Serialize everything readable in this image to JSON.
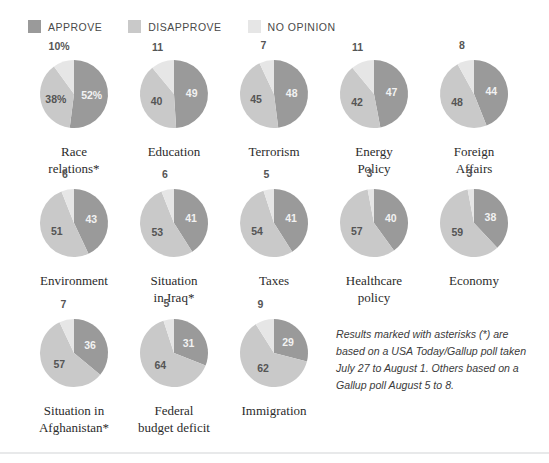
{
  "legend": {
    "items": [
      {
        "label": "APPROVE",
        "key": "approve",
        "color": "#9a9a9a"
      },
      {
        "label": "DISAPPROVE",
        "key": "disapprove",
        "color": "#c9c9c9"
      },
      {
        "label": "NO OPINION",
        "key": "noopinion",
        "color": "#e6e6e6"
      }
    ]
  },
  "footnote": {
    "text": "Results marked with asterisks (*) are based on a USA Today/Gallup poll taken July 27 to August 1. Others based on a Gallup poll August 5 to 8."
  },
  "chart_data": {
    "type": "pie",
    "title": "",
    "legend": [
      "APPROVE",
      "DISAPPROVE",
      "NO OPINION"
    ],
    "legend_position": "top-left",
    "series_colors": [
      "#9a9a9a",
      "#c9c9c9",
      "#e6e6e6"
    ],
    "value_unit": "percent",
    "note": "Results marked with asterisks (*) are based on a USA Today/Gallup poll taken July 27 to August 1. Others based on a Gallup poll August 5 to 8.",
    "charts": [
      {
        "label": "Race relations*",
        "label_lines": [
          "Race",
          "relations*"
        ],
        "approve": 52,
        "disapprove": 38,
        "no_opinion": 10,
        "approve_text": "52%",
        "disapprove_text": "38%",
        "no_opinion_text": "10%"
      },
      {
        "label": "Education",
        "label_lines": [
          "Education"
        ],
        "approve": 49,
        "disapprove": 40,
        "no_opinion": 11,
        "approve_text": "49",
        "disapprove_text": "40",
        "no_opinion_text": "11"
      },
      {
        "label": "Terrorism",
        "label_lines": [
          "Terrorism"
        ],
        "approve": 48,
        "disapprove": 45,
        "no_opinion": 7,
        "approve_text": "48",
        "disapprove_text": "45",
        "no_opinion_text": "7"
      },
      {
        "label": "Energy Policy",
        "label_lines": [
          "Energy",
          "Policy"
        ],
        "approve": 47,
        "disapprove": 42,
        "no_opinion": 11,
        "approve_text": "47",
        "disapprove_text": "42",
        "no_opinion_text": "11"
      },
      {
        "label": "Foreign Affairs",
        "label_lines": [
          "Foreign",
          "Affairs"
        ],
        "approve": 44,
        "disapprove": 48,
        "no_opinion": 8,
        "approve_text": "44",
        "disapprove_text": "48",
        "no_opinion_text": "8"
      },
      {
        "label": "Environment",
        "label_lines": [
          "Environment"
        ],
        "approve": 43,
        "disapprove": 51,
        "no_opinion": 6,
        "approve_text": "43",
        "disapprove_text": "51",
        "no_opinion_text": "6"
      },
      {
        "label": "Situation in Iraq*",
        "label_lines": [
          "Situation",
          "in Iraq*"
        ],
        "approve": 41,
        "disapprove": 53,
        "no_opinion": 6,
        "approve_text": "41",
        "disapprove_text": "53",
        "no_opinion_text": "6"
      },
      {
        "label": "Taxes",
        "label_lines": [
          "Taxes"
        ],
        "approve": 41,
        "disapprove": 54,
        "no_opinion": 5,
        "approve_text": "41",
        "disapprove_text": "54",
        "no_opinion_text": "5"
      },
      {
        "label": "Healthcare policy",
        "label_lines": [
          "Healthcare",
          "policy"
        ],
        "approve": 40,
        "disapprove": 57,
        "no_opinion": 3,
        "approve_text": "40",
        "disapprove_text": "57",
        "no_opinion_text": "3"
      },
      {
        "label": "Economy",
        "label_lines": [
          "Economy"
        ],
        "approve": 38,
        "disapprove": 59,
        "no_opinion": 3,
        "approve_text": "38",
        "disapprove_text": "59",
        "no_opinion_text": "3"
      },
      {
        "label": "Situation in Afghanistan*",
        "label_lines": [
          "Situation in",
          "Afghanistan*"
        ],
        "approve": 36,
        "disapprove": 57,
        "no_opinion": 7,
        "approve_text": "36",
        "disapprove_text": "57",
        "no_opinion_text": "7"
      },
      {
        "label": "Federal budget deficit",
        "label_lines": [
          "Federal",
          "budget deficit"
        ],
        "approve": 31,
        "disapprove": 64,
        "no_opinion": 5,
        "approve_text": "31",
        "disapprove_text": "64",
        "no_opinion_text": "5"
      },
      {
        "label": "Immigration",
        "label_lines": [
          "Immigration"
        ],
        "approve": 29,
        "disapprove": 62,
        "no_opinion": 9,
        "approve_text": "29",
        "disapprove_text": "62",
        "no_opinion_text": "9"
      }
    ]
  }
}
